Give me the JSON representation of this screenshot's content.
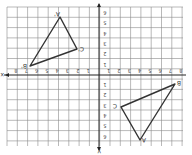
{
  "diagram": {
    "type": "coordinate-plane-reflection",
    "orientation": "rotated-180",
    "grid": {
      "x_min": -8,
      "x_max": 8,
      "y_min": -6,
      "y_max": 7
    },
    "axes": {
      "x_label": "x",
      "y_label": "y"
    },
    "x_ticks": [
      "-8",
      "-7",
      "-6",
      "-5",
      "-4",
      "-3",
      "-2",
      "-1",
      "0",
      "1",
      "2",
      "3",
      "4",
      "5",
      "6",
      "7",
      "8"
    ],
    "y_ticks": [
      "6",
      "5",
      "4",
      "3",
      "2",
      "1",
      "0",
      "-1",
      "-2",
      "-3",
      "-4",
      "-5",
      "-6"
    ],
    "triangles": [
      {
        "name": "image",
        "vertices": [
          {
            "label": "A'",
            "px": [
              60,
              17
            ]
          },
          {
            "label": "C'",
            "px": [
              77,
              49
            ]
          },
          {
            "label": "B'",
            "px": [
              30,
              66
            ]
          }
        ]
      },
      {
        "name": "preimage",
        "vertices": [
          {
            "label": "B",
            "px": [
              175,
              84
            ]
          },
          {
            "label": "C",
            "px": [
              121,
              107
            ]
          },
          {
            "label": "A",
            "px": [
              140,
              140
            ]
          }
        ]
      }
    ],
    "colors": {
      "grid": "#8a8a8a",
      "axis": "#222222",
      "triangle": "#333333",
      "background": "#ffffff"
    }
  }
}
